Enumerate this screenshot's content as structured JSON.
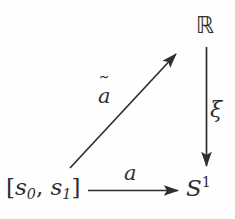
{
  "figure": {
    "kind": "commutative-diagram",
    "width": 235,
    "height": 219,
    "background_color": "#fefefe",
    "stroke_color": "#2f2f2f",
    "text_color": "#2f2f2f"
  },
  "nodes": {
    "domain": {
      "label": "[s0, s1]",
      "bracket_open": "[",
      "bracket_close": "]",
      "var": "s",
      "sub_first": "0",
      "comma": ", ",
      "sub_second": "1"
    },
    "reals": {
      "label": "ℝ",
      "name": "blackboard-bold-R"
    },
    "circle": {
      "label": "S1",
      "base": "S",
      "exponent": "1"
    }
  },
  "arrows": {
    "lift": {
      "label": "a",
      "accent": "˜",
      "name": "a-tilde",
      "from": "domain",
      "to": "reals",
      "direction": "diagonal-up-right"
    },
    "projection": {
      "label": "ξ",
      "name": "xi",
      "from": "reals",
      "to": "circle",
      "direction": "down"
    },
    "base_map": {
      "label": "a",
      "name": "a",
      "from": "domain",
      "to": "circle",
      "direction": "right"
    }
  }
}
